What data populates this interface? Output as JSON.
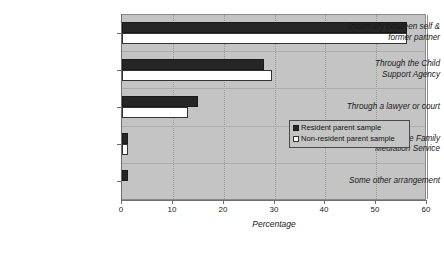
{
  "chart_data": {
    "type": "bar",
    "orientation": "horizontal",
    "title": "",
    "xlabel": "Percentage",
    "ylabel": "",
    "xlim": [
      0,
      60
    ],
    "xticks": [
      0,
      10,
      20,
      30,
      40,
      50,
      60
    ],
    "xtick_labels": [
      "0",
      "10",
      "20",
      "30",
      "40",
      "50",
      "60"
    ],
    "grid": true,
    "legend_position": "center-right",
    "categories": [
      "Informally between self & former partner",
      "Through the Child Support Agency",
      "Through a lawyer or court",
      "Through the Family Mediation Service",
      "Some other arrangement"
    ],
    "category_lines": [
      [
        "Informally between self &",
        "former partner"
      ],
      [
        "Through the Child",
        "Support Agency"
      ],
      [
        "Through a lawyer or court"
      ],
      [
        "Through the Family",
        "Mediation Service"
      ],
      [
        "Some other arrangement"
      ]
    ],
    "series": [
      {
        "name": "Resident parent sample",
        "color": "#262626",
        "style": "solid-black",
        "values": [
          56,
          28,
          15,
          1.2,
          1.2
        ]
      },
      {
        "name": "Non-resident parent sample",
        "color": "#ffffff",
        "style": "white-outline",
        "values": [
          56,
          29.5,
          13,
          1.2,
          0
        ]
      }
    ]
  },
  "legend": {
    "items": [
      {
        "label": "Resident parent sample",
        "swatch": "dark-square-swatch"
      },
      {
        "label": "Non-resident parent sample",
        "swatch": "white-square-swatch"
      }
    ]
  },
  "colors": {
    "plot_background": "#c4c4c4",
    "page_background": "#ffffff",
    "series_resident": "#262626",
    "series_non_resident": "#ffffff",
    "axis": "#6e6e6e",
    "gridline": "#9a9a9a"
  }
}
